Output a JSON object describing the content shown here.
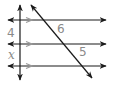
{
  "diagram": {
    "type": "parallel-lines-transversals",
    "parallel_lines": [
      {
        "y": 20,
        "x1": 8,
        "x2": 106
      },
      {
        "y": 44,
        "x1": 8,
        "x2": 106
      },
      {
        "y": 66,
        "x1": 8,
        "x2": 106
      }
    ],
    "transversals": [
      {
        "name": "vertical",
        "x1": 20,
        "y1": 5,
        "x2": 20,
        "y2": 80
      },
      {
        "name": "diagonal",
        "x1": 31,
        "y1": 5,
        "x2": 92,
        "y2": 78
      }
    ],
    "segment_labels": {
      "vertical_top": "4",
      "vertical_bottom": "x",
      "diagonal_top": "6",
      "diagonal_bottom": "5"
    },
    "colors": {
      "line": "#1a1a1a",
      "parallel_marker": "#9a9a9a",
      "label": "#8a8a8a"
    }
  }
}
